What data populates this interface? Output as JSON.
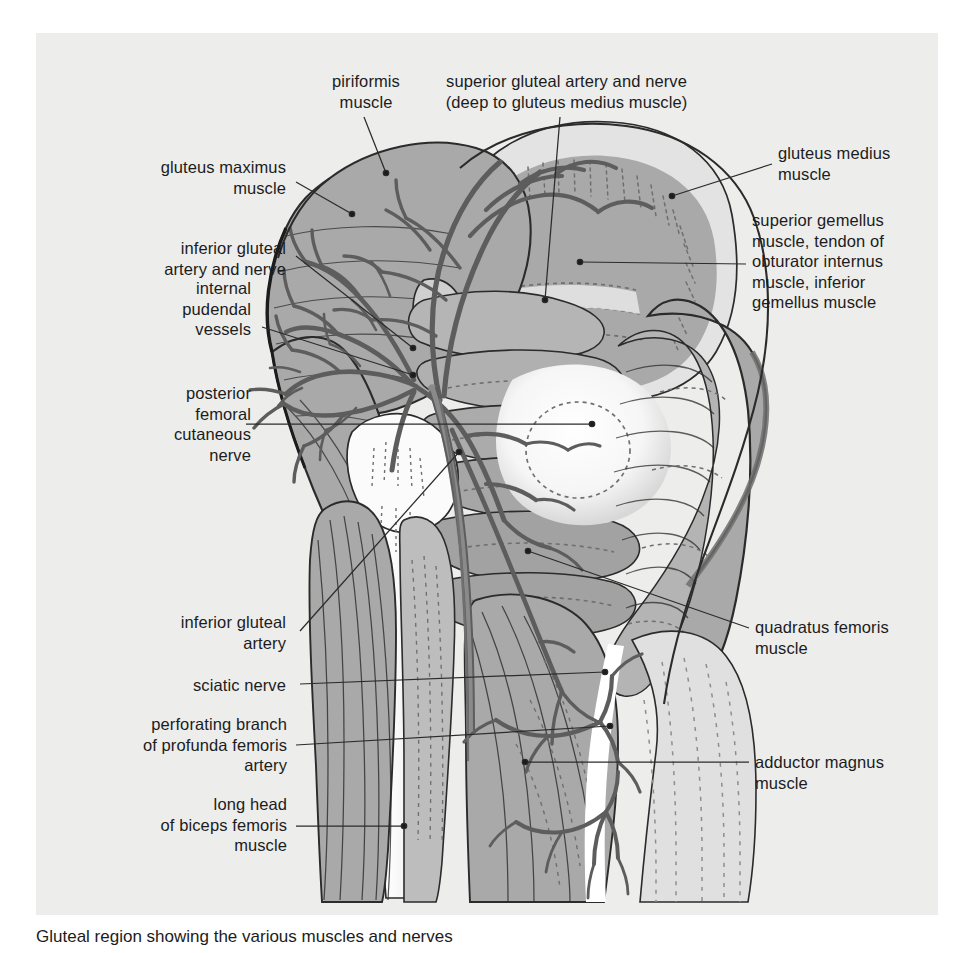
{
  "figure": {
    "kind": "anatomical-illustration",
    "caption": "Gluteal region showing the various muscles and nerves",
    "panel": {
      "background_color": "#ededec",
      "page_background_color": "#ffffff"
    },
    "palette": {
      "muscle_mid_gray": "#a9a9a9",
      "muscle_light_gray": "#cfcfcf",
      "muscle_pale_gray": "#dddddd",
      "bone_white": "#fbfbfb",
      "vessel_gray": "#6f6f6f",
      "outline_dark": "#2b2b2b",
      "leader_line": "#2b2b2b",
      "label_text": "#1c1c1c"
    }
  },
  "labels": [
    {
      "id": "piriformis-muscle",
      "text": "piriformis\nmuscle",
      "align": "center",
      "x": 296,
      "y": 71,
      "width": 140,
      "leader": {
        "from": [
          364,
          117
        ],
        "to": [
          386,
          173
        ]
      }
    },
    {
      "id": "superior-gluteal-artery-and-nerve",
      "text": "superior gluteal artery and nerve\n(deep to gluteus medius muscle)",
      "align": "center",
      "x": 424,
      "y": 71,
      "width": 285,
      "leader": {
        "from": [
          560,
          117
        ],
        "to": [
          545,
          300
        ]
      }
    },
    {
      "id": "gluteus-maximus-muscle",
      "text": "gluteus maximus\nmuscle",
      "align": "right",
      "x": 86,
      "y": 157,
      "width": 200,
      "leader": {
        "from": [
          296,
          182
        ],
        "to": [
          352,
          214
        ]
      }
    },
    {
      "id": "gluteus-medius-muscle",
      "text": "gluteus medius\nmuscle",
      "align": "left",
      "x": 778,
      "y": 143,
      "width": 180,
      "leader": {
        "from": [
          772,
          164
        ],
        "to": [
          672,
          196
        ]
      }
    },
    {
      "id": "inferior-gluteal-artery-and-nerve",
      "text": "inferior gluteal\nartery and nerve",
      "align": "right",
      "x": 86,
      "y": 238,
      "width": 200,
      "leader": {
        "from": [
          296,
          256
        ],
        "to": [
          413,
          348
        ]
      }
    },
    {
      "id": "superior-gemellus-obturator-internus-inferior-gemellus",
      "text": "superior gemellus\nmuscle, tendon of\nobturator internus\nmuscle, inferior\ngemellus muscle",
      "align": "left",
      "x": 752,
      "y": 210,
      "width": 200,
      "leader": {
        "from": [
          746,
          264
        ],
        "to": [
          580,
          262
        ]
      }
    },
    {
      "id": "internal-pudendal-vessels",
      "text": "internal\npudendal\nvessels",
      "align": "right",
      "x": 86,
      "y": 278,
      "width": 165,
      "leader": {
        "from": [
          262,
          327
        ],
        "to": [
          413,
          375
        ]
      }
    },
    {
      "id": "posterior-femoral-cutaneous-nerve",
      "text": "posterior\nfemoral\ncutaneous\nnerve",
      "align": "right",
      "x": 86,
      "y": 383,
      "width": 165,
      "leader": {
        "from": [
          246,
          424
        ],
        "to": [
          592,
          424
        ]
      }
    },
    {
      "id": "inferior-gluteal-artery",
      "text": "inferior gluteal\nartery",
      "align": "right",
      "x": 86,
      "y": 612,
      "width": 200,
      "leader": {
        "from": [
          300,
          631
        ],
        "to": [
          459,
          452
        ]
      }
    },
    {
      "id": "quadratus-femoris-muscle",
      "text": "quadratus femoris\nmuscle",
      "align": "left",
      "x": 755,
      "y": 617,
      "width": 200,
      "leader": {
        "from": [
          749,
          628
        ],
        "to": [
          528,
          551
        ]
      }
    },
    {
      "id": "sciatic-nerve",
      "text": "sciatic nerve",
      "align": "right",
      "x": 86,
      "y": 675,
      "width": 200,
      "leader": {
        "from": [
          300,
          684
        ],
        "to": [
          605,
          672
        ]
      }
    },
    {
      "id": "perforating-branch-of-profunda-femoris-artery",
      "text": "perforating branch\nof profunda femoris\nartery",
      "align": "right",
      "x": 72,
      "y": 714,
      "width": 215,
      "leader": {
        "from": [
          296,
          745
        ],
        "to": [
          610,
          726
        ]
      }
    },
    {
      "id": "adductor-magnus-muscle",
      "text": "adductor magnus\nmuscle",
      "align": "left",
      "x": 755,
      "y": 752,
      "width": 200,
      "leader": {
        "from": [
          749,
          762
        ],
        "to": [
          525,
          762
        ]
      }
    },
    {
      "id": "long-head-of-biceps-femoris-muscle",
      "text": "long head\nof biceps femoris\nmuscle",
      "align": "right",
      "x": 72,
      "y": 794,
      "width": 215,
      "leader": {
        "from": [
          296,
          826
        ],
        "to": [
          404,
          826
        ]
      }
    }
  ]
}
